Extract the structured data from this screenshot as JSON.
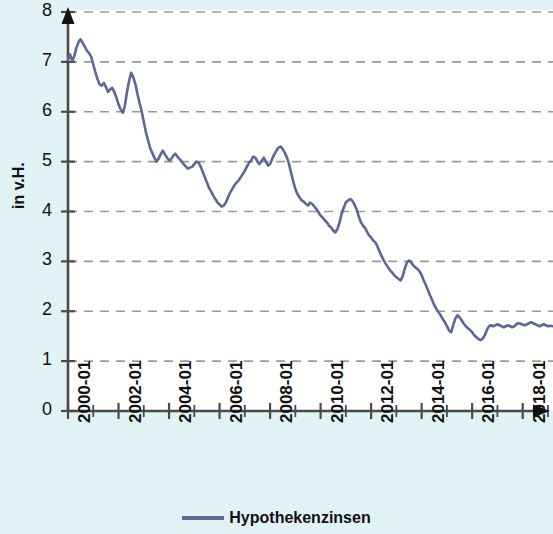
{
  "chart_data": {
    "type": "line",
    "title": "",
    "subtitle": "",
    "xlabel": "",
    "ylabel": "in v.H.",
    "ylim": [
      0,
      8
    ],
    "ytick_labels": [
      "0",
      "1",
      "2",
      "3",
      "4",
      "5",
      "6",
      "7",
      "8"
    ],
    "ytick_values": [
      0,
      1,
      2,
      3,
      4,
      5,
      6,
      7,
      8
    ],
    "xtick_labels": [
      "2000-01",
      "2002-01",
      "2004-01",
      "2006-01",
      "2008-01",
      "2010-01",
      "2012-01",
      "2014-01",
      "2016-01",
      "2018-01"
    ],
    "xtick_values": [
      2000,
      2002,
      2004,
      2006,
      2008,
      2010,
      2012,
      2014,
      2016,
      2018
    ],
    "xlim": [
      2000,
      2019.2
    ],
    "grid": "horizontal-dashed",
    "legend_position": "bottom-center",
    "legend": [
      "Hypothekenzinsen"
    ],
    "line_color": "#5d6894",
    "background_color": "#e2f3f6",
    "plot_background_color": "#ffffff",
    "grid_color": "#9a9a9a",
    "axis_color": "#4a4a4a",
    "series": [
      {
        "name": "Hypothekenzinsen",
        "color": "#5d6894",
        "x": [
          2000.0,
          2000.08,
          2000.17,
          2000.25,
          2000.33,
          2000.42,
          2000.5,
          2000.58,
          2000.67,
          2000.75,
          2000.83,
          2000.92,
          2001.0,
          2001.08,
          2001.17,
          2001.25,
          2001.33,
          2001.42,
          2001.5,
          2001.58,
          2001.67,
          2001.75,
          2001.83,
          2001.92,
          2002.0,
          2002.08,
          2002.17,
          2002.25,
          2002.33,
          2002.42,
          2002.5,
          2002.58,
          2002.67,
          2002.75,
          2002.83,
          2002.92,
          2003.0,
          2003.08,
          2003.17,
          2003.25,
          2003.33,
          2003.42,
          2003.5,
          2003.58,
          2003.67,
          2003.75,
          2003.83,
          2003.92,
          2004.0,
          2004.08,
          2004.17,
          2004.25,
          2004.33,
          2004.42,
          2004.5,
          2004.58,
          2004.67,
          2004.75,
          2004.83,
          2004.92,
          2005.0,
          2005.08,
          2005.17,
          2005.25,
          2005.33,
          2005.42,
          2005.5,
          2005.58,
          2005.67,
          2005.75,
          2005.83,
          2005.92,
          2006.0,
          2006.08,
          2006.17,
          2006.25,
          2006.33,
          2006.42,
          2006.5,
          2006.58,
          2006.67,
          2006.75,
          2006.83,
          2006.92,
          2007.0,
          2007.08,
          2007.17,
          2007.25,
          2007.33,
          2007.42,
          2007.5,
          2007.58,
          2007.67,
          2007.75,
          2007.83,
          2007.92,
          2008.0,
          2008.08,
          2008.17,
          2008.25,
          2008.33,
          2008.42,
          2008.5,
          2008.58,
          2008.67,
          2008.75,
          2008.83,
          2008.92,
          2009.0,
          2009.08,
          2009.17,
          2009.25,
          2009.33,
          2009.42,
          2009.5,
          2009.58,
          2009.67,
          2009.75,
          2009.83,
          2009.92,
          2010.0,
          2010.08,
          2010.17,
          2010.25,
          2010.33,
          2010.42,
          2010.5,
          2010.58,
          2010.67,
          2010.75,
          2010.83,
          2010.92,
          2011.0,
          2011.08,
          2011.17,
          2011.25,
          2011.33,
          2011.42,
          2011.5,
          2011.58,
          2011.67,
          2011.75,
          2011.83,
          2011.92,
          2012.0,
          2012.08,
          2012.17,
          2012.25,
          2012.33,
          2012.42,
          2012.5,
          2012.58,
          2012.67,
          2012.75,
          2012.83,
          2012.92,
          2013.0,
          2013.08,
          2013.17,
          2013.25,
          2013.33,
          2013.42,
          2013.5,
          2013.58,
          2013.67,
          2013.75,
          2013.83,
          2013.92,
          2014.0,
          2014.08,
          2014.17,
          2014.25,
          2014.33,
          2014.42,
          2014.5,
          2014.58,
          2014.67,
          2014.75,
          2014.83,
          2014.92,
          2015.0,
          2015.08,
          2015.17,
          2015.25,
          2015.33,
          2015.42,
          2015.5,
          2015.58,
          2015.67,
          2015.75,
          2015.83,
          2015.92,
          2016.0,
          2016.08,
          2016.17,
          2016.25,
          2016.33,
          2016.42,
          2016.5,
          2016.58,
          2016.67,
          2016.75,
          2016.83,
          2016.92,
          2017.0,
          2017.08,
          2017.17,
          2017.25,
          2017.33,
          2017.42,
          2017.5,
          2017.58,
          2017.67,
          2017.75,
          2017.83,
          2017.92,
          2018.0,
          2018.08,
          2018.17,
          2018.25,
          2018.33,
          2018.42,
          2018.5,
          2018.58,
          2018.67,
          2018.75,
          2018.83,
          2018.92,
          2019.0,
          2019.1,
          2019.2
        ],
        "values": [
          7.05,
          7.15,
          7.02,
          7.12,
          7.28,
          7.4,
          7.45,
          7.38,
          7.3,
          7.22,
          7.18,
          7.1,
          6.95,
          6.8,
          6.65,
          6.55,
          6.52,
          6.58,
          6.5,
          6.4,
          6.45,
          6.48,
          6.4,
          6.28,
          6.15,
          6.05,
          5.98,
          6.12,
          6.38,
          6.62,
          6.78,
          6.7,
          6.55,
          6.35,
          6.18,
          6.0,
          5.8,
          5.6,
          5.42,
          5.28,
          5.18,
          5.08,
          5.0,
          5.05,
          5.15,
          5.22,
          5.15,
          5.08,
          5.02,
          5.05,
          5.12,
          5.16,
          5.1,
          5.05,
          5.0,
          4.95,
          4.9,
          4.86,
          4.88,
          4.9,
          4.95,
          5.0,
          4.98,
          4.9,
          4.8,
          4.68,
          4.58,
          4.48,
          4.4,
          4.32,
          4.25,
          4.18,
          4.14,
          4.1,
          4.12,
          4.18,
          4.28,
          4.38,
          4.45,
          4.52,
          4.58,
          4.62,
          4.68,
          4.75,
          4.82,
          4.9,
          4.98,
          5.02,
          5.1,
          5.08,
          5.0,
          4.95,
          5.02,
          5.08,
          5.0,
          4.92,
          4.95,
          5.05,
          5.15,
          5.22,
          5.28,
          5.3,
          5.25,
          5.18,
          5.08,
          4.95,
          4.78,
          4.6,
          4.45,
          4.35,
          4.28,
          4.22,
          4.2,
          4.15,
          4.12,
          4.18,
          4.15,
          4.1,
          4.05,
          3.98,
          3.92,
          3.88,
          3.82,
          3.78,
          3.72,
          3.68,
          3.62,
          3.58,
          3.65,
          3.78,
          3.95,
          4.08,
          4.18,
          4.22,
          4.25,
          4.22,
          4.15,
          4.05,
          3.92,
          3.8,
          3.72,
          3.68,
          3.6,
          3.52,
          3.48,
          3.42,
          3.38,
          3.3,
          3.2,
          3.1,
          3.02,
          2.95,
          2.88,
          2.82,
          2.78,
          2.72,
          2.68,
          2.65,
          2.62,
          2.7,
          2.85,
          2.98,
          3.02,
          2.98,
          2.92,
          2.88,
          2.85,
          2.8,
          2.72,
          2.62,
          2.52,
          2.42,
          2.32,
          2.22,
          2.12,
          2.05,
          1.98,
          1.92,
          1.85,
          1.78,
          1.7,
          1.62,
          1.58,
          1.72,
          1.85,
          1.92,
          1.88,
          1.82,
          1.75,
          1.7,
          1.66,
          1.62,
          1.58,
          1.52,
          1.48,
          1.44,
          1.42,
          1.45,
          1.52,
          1.62,
          1.7,
          1.72,
          1.7,
          1.72,
          1.74,
          1.72,
          1.7,
          1.68,
          1.7,
          1.72,
          1.7,
          1.68,
          1.7,
          1.74,
          1.76,
          1.75,
          1.73,
          1.72,
          1.74,
          1.76,
          1.78,
          1.76,
          1.74,
          1.72,
          1.7,
          1.72,
          1.74,
          1.72,
          1.7,
          1.71,
          1.7
        ]
      }
    ]
  },
  "axis": {
    "y_label": "in v.H.",
    "y_ticks": [
      "8",
      "7",
      "6",
      "5",
      "4",
      "3",
      "2",
      "1",
      "0"
    ],
    "x_ticks": [
      "2000-01",
      "2002-01",
      "2004-01",
      "2006-01",
      "2008-01",
      "2010-01",
      "2012-01",
      "2014-01",
      "2016-01",
      "2018-01"
    ]
  },
  "legend": {
    "label": "Hypothekenzinsen"
  }
}
